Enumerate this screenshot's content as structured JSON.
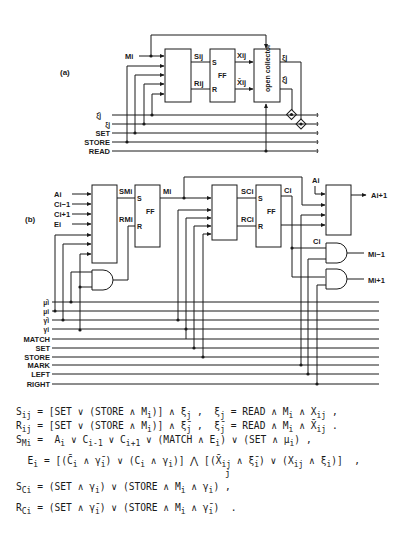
{
  "figure_a": {
    "label": "(a)",
    "input_label": "Mi",
    "ff_label": "FF",
    "ff_s": "S",
    "ff_r": "R",
    "s_label": "Sij",
    "r_label": "Rij",
    "x_label": "Xij",
    "xbar_label": "X̄ij",
    "open_collector_label": "open collector",
    "xi_label": "ξj",
    "xibar_label": "ξ̄j",
    "bus_lines": [
      "ξ̄j",
      "ξj",
      "SET",
      "STORE",
      "READ"
    ]
  },
  "figure_b": {
    "label": "(b)",
    "inputs": [
      "Ai",
      "Ci−1",
      "Ci+1",
      "Ei"
    ],
    "sm_label": "SMi",
    "rm_label": "RMi",
    "ff1_label": "FF",
    "m_label": "Mi",
    "sc_label": "SCi",
    "rc_label": "RCi",
    "ff2_label": "FF",
    "c_label": "Ci",
    "a_in_label": "Ai",
    "a_out_label": "Ai+1",
    "c_and_label": "Ci",
    "m_prev_label": "Mi−1",
    "m_next_label": "Mi+1",
    "bus_lines": [
      "μ̄i",
      "μi",
      "γ̄i",
      "γi",
      "MATCH",
      "SET",
      "STORE",
      "MARK",
      "LEFT",
      "RIGHT"
    ]
  },
  "equations": [
    "S_ij = [SET ∨ (STORE ∧ M_i)] ∧ ξ_j ,  ξ_j = READ ∧ M_i ∧ X_ij ,",
    "R_ij = [SET ∨ (STORE ∧ M_i)] ∧ ξ̄_j ,  ξ̄_j = READ ∧ M_i ∧ X̄_ij .",
    "S_Mi =  A_i ∨ C_i-1 ∨ C_i+1 ∨ (MATCH ∧ E_i) ∨ (SET ∧ μ_i) ,",
    "E_i = [(C̄_i ∧ γ̄_i) ∨ (C_i ∧ γ_i)] ⋀_j [(X̄_ij ∧ ξ̄_i) ∨ (X_ij ∧ ξ_i)]  ,",
    "S_Ci = (SET ∧ γ_i) ∨ (STORE ∧ M_i ∧ γ_i) ,",
    "R_Ci = (SET ∧ γ̄_i) ∨ (STORE ∧ M_i ∧ γ̄_i)  ."
  ],
  "eq_text": {
    "e1a": "S",
    "e1s": "ij",
    "e1b": " = [SET ∨ (STORE ∧ M",
    "e1c": "i",
    "e1d": ")] ∧ ξ",
    "e1e": "j",
    "e1f": " ,  ξ",
    "e1g": "j",
    "e1h": " = READ ∧ M",
    "e1i": "i",
    "e1j": " ∧ X",
    "e1k": "ij",
    "e1l": " ,",
    "e2a": "R",
    "e2s": "ij",
    "e2b": " = [SET ∨ (STORE ∧ M",
    "e2c": "i",
    "e2d": ")] ∧ ξ̄",
    "e2e": "j",
    "e2f": " ,  ξ̄",
    "e2g": "j",
    "e2h": " = READ ∧ M",
    "e2i": "i",
    "e2j": " ∧ X̄",
    "e2k": "ij",
    "e2l": " .",
    "e3a": "S",
    "e3s": "Mi",
    "e3b": " =  A",
    "e3c": "i",
    "e3d": " ∨ C",
    "e3e": "i-1",
    "e3f": " ∨ C",
    "e3g": "i+1",
    "e3h": " ∨ (MATCH ∧ E",
    "e3i": "i",
    "e3j": ") ∨ (SET ∧ μ",
    "e3k": "i",
    "e3l": ") ,",
    "e4a": "  E",
    "e4s": "i",
    "e4b": " = [(C̄",
    "e4c": "i",
    "e4d": " ∧ γ̄",
    "e4e": "i",
    "e4f": ") ∨ (C",
    "e4g": "i",
    "e4h": " ∧ γ",
    "e4i": "i",
    "e4j": ")] ⋀ [(X̄",
    "e4k": "ij",
    "e4l": " ∧ ξ̄",
    "e4m": "i",
    "e4n": ") ∨ (X",
    "e4o": "ij",
    "e4p": " ∧ ξ",
    "e4q": "i",
    "e4r": ")]  ,",
    "e4j2": "j",
    "e5a": "S",
    "e5s": "Ci",
    "e5b": " = (SET ∧ γ",
    "e5c": "i",
    "e5d": ") ∨ (STORE ∧ M",
    "e5e": "i",
    "e5f": " ∧ γ",
    "e5g": "i",
    "e5h": ") ,",
    "e6a": "R",
    "e6s": "Ci",
    "e6b": " = (SET ∧ γ̄",
    "e6c": "i",
    "e6d": ") ∨ (STORE ∧ M",
    "e6e": "i",
    "e6f": " ∧ γ̄",
    "e6g": "i",
    "e6h": ")  ."
  }
}
